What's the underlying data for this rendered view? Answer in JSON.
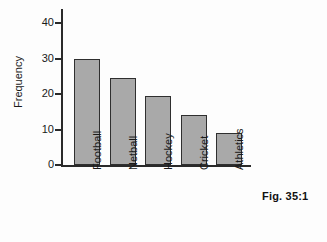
{
  "chart_data": {
    "type": "bar",
    "title": "",
    "subtitle": "",
    "xlabel": "",
    "ylabel": "Frequency",
    "categories": [
      "Football",
      "Netball",
      "Hockey",
      "Cricket",
      "Athletics"
    ],
    "values": [
      30,
      24.5,
      19.5,
      14,
      9
    ],
    "ylim": [
      0,
      44
    ],
    "yticks": [
      0,
      10,
      20,
      30,
      40
    ],
    "ytick_labels": [
      "0",
      "10",
      "20",
      "30",
      "40"
    ],
    "grid": false,
    "legend": null,
    "bar_color": "#a9a9a9",
    "bar_edge_color": "#2f2f2f",
    "axis_color": "#2a2a2a"
  },
  "caption": {
    "text": "Fig. 35:1"
  }
}
